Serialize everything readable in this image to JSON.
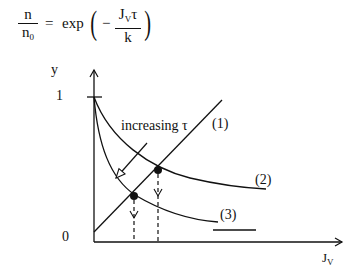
{
  "equation": {
    "lhs_numerator": "n",
    "lhs_denominator_base": "n",
    "lhs_denominator_sub": "0",
    "equals": "=",
    "func": "exp",
    "open_paren": "(",
    "minus": "−",
    "rhs_numerator_base": "J",
    "rhs_numerator_sub": "V",
    "rhs_numerator_tail": "τ",
    "rhs_denominator": "k",
    "close_paren": ")"
  },
  "axes": {
    "y_label": "y",
    "y_tick_one": "1",
    "origin_label": "0",
    "x_label_base": "J",
    "x_label_sub": "V"
  },
  "annotations": {
    "arrow_label": "increasing τ",
    "curve_labels": [
      "(1)",
      "(2)",
      "(3)"
    ]
  },
  "colors": {
    "ink": "#111111",
    "background": "#ffffff"
  }
}
